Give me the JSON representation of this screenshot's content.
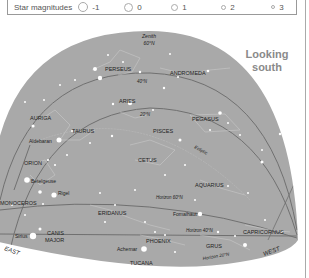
{
  "legend": {
    "title": "Star magnitudes",
    "items": [
      {
        "label": "-1",
        "size": 9
      },
      {
        "label": "0",
        "size": 8
      },
      {
        "label": "1",
        "size": 6
      },
      {
        "label": "2",
        "size": 4
      },
      {
        "label": "3",
        "size": 3
      }
    ]
  },
  "heading": {
    "line1": "Looking",
    "line2": "south"
  },
  "zenith": {
    "line1": "Zenith",
    "line2": "60°N"
  },
  "directions": {
    "east": "EAST",
    "west": "WEST"
  },
  "constellations": {
    "perseus": "PERSEUS",
    "andromeda": "ANDROMEDA",
    "aries": "ARIES",
    "auriga": "AURIGA",
    "taurus": "TAURUS",
    "pisces": "PISCES",
    "pegasus": "PEGASUS",
    "orion": "ORION",
    "cetus": "CETUS",
    "monoceros": "MONOCEROS",
    "aquarius": "AQUARIUS",
    "eridanus": "ERIDANUS",
    "canis_major_1": "CANIS",
    "canis_major_2": "MAJOR",
    "phoenix": "PHOENIX",
    "grus": "GRUS",
    "capricornus": "CAPRICORNUS",
    "tucana": "TUCANA"
  },
  "stars": {
    "aldebaran": "Aldebaran",
    "betelgeuse": "Betelgeuse",
    "rigel": "Rigel",
    "sirius": "Sirius",
    "achernar": "Achernar",
    "fomalhaut": "Fomalhaut"
  },
  "lines": {
    "ecliptic": "Ecliptic",
    "lat_40_upper": "40°N",
    "lat_20_upper": "20°N",
    "horizon_60": "Horizon 60°N",
    "horizon_40": "Horizon 40°N",
    "horizon_20": "Horizon 20°N"
  },
  "colors": {
    "sky": "#a9a9a9",
    "star": "#ffffff",
    "line": "#6e6e6e",
    "heading": "#8a8a8a"
  }
}
